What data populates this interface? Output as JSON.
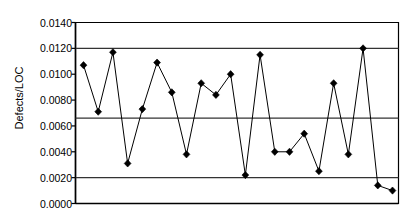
{
  "chart_data": {
    "type": "line",
    "title": "",
    "xlabel": "",
    "ylabel": "Defects/LOC",
    "ylim": [
      0.0,
      0.014
    ],
    "xlim": [
      0,
      23
    ],
    "grid": false,
    "legend": "none",
    "y_ticks": [
      "0.0000",
      "0.0020",
      "0.0040",
      "0.0060",
      "0.0080",
      "0.0100",
      "0.0120",
      "0.0140"
    ],
    "y_tick_values": [
      0.0,
      0.002,
      0.004,
      0.006,
      0.008,
      0.01,
      0.012,
      0.014
    ],
    "x_ticks": [],
    "x_tick_labels": [],
    "marker": "diamond",
    "marker_color": "#000000",
    "line_color": "#000000",
    "axis_color": "#000000",
    "reference_line_color": "#333333",
    "reference_lines": [
      {
        "name": "UCL",
        "value": 0.012
      },
      {
        "name": "CL",
        "value": 0.0066
      },
      {
        "name": "LCL",
        "value": 0.002
      }
    ],
    "series": [
      {
        "name": "Defects/LOC",
        "x": [
          1,
          2,
          3,
          4,
          5,
          6,
          7,
          8,
          9,
          10,
          11,
          12,
          13,
          14,
          15,
          16,
          17,
          18,
          19,
          20,
          21,
          22
        ],
        "values": [
          0.0107,
          0.0071,
          0.0117,
          0.0031,
          0.0073,
          0.0109,
          0.0086,
          0.0038,
          0.0093,
          0.0084,
          0.01,
          0.0022,
          0.0115,
          0.004,
          0.004,
          0.0054,
          0.0025,
          0.0093,
          0.0038,
          0.012,
          0.0014,
          0.001
        ]
      }
    ]
  }
}
